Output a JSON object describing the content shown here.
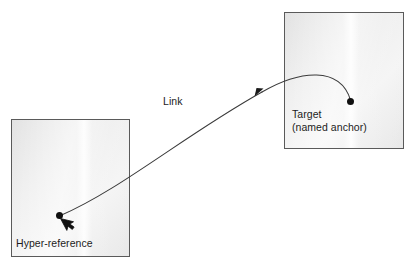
{
  "diagram": {
    "background_color": "#ffffff",
    "nodes": [
      {
        "id": "hyper-reference",
        "label": "Hyper-reference",
        "role": "source-page",
        "fill_color": "#ededed",
        "border_color": "#5a5a5a",
        "anchor_dot_color": "#101010",
        "has_cursor": true
      },
      {
        "id": "target",
        "label_line_1": "Target",
        "label_line_2": "(named anchor)",
        "role": "destination-page",
        "fill_color": "#ededed",
        "border_color": "#5a5a5a",
        "anchor_dot_color": "#101010",
        "has_cursor": false
      }
    ],
    "edge": {
      "id": "link",
      "label": "Link",
      "from": "hyper-reference",
      "to": "target",
      "stroke_color": "#3a3a3a",
      "arrowhead_color": "#1a1a1a",
      "style": "curved-arrow"
    },
    "icons": {
      "cursor": "mouse-cursor-icon",
      "arrowhead": "arrowhead-icon"
    }
  }
}
